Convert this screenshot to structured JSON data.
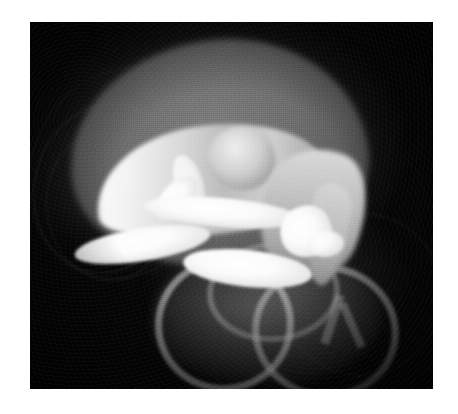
{
  "figure": {
    "kind": "grayscale-radiographic-scan",
    "modality_appearance": "micro-CT / x-ray volume rendering",
    "caption": "",
    "canvas": {
      "width_px": 458,
      "height_px": 414,
      "margin_color": "#ffffff"
    },
    "plate": {
      "left_px": 30,
      "top_px": 22,
      "width_px": 403,
      "height_px": 367,
      "background_color": "#050505"
    },
    "palette": {
      "background": "#050505",
      "page_margin": "#ffffff",
      "soft_tissue_mid": "#6e6e6e",
      "soft_tissue_light": "#8a8a8a",
      "dense_bone": "#ffffff",
      "bone_shadow": "#9a9a9a",
      "membrane_wisp": "#8c8c8c"
    },
    "structures": [
      {
        "id": "soft-tissue-mass",
        "label": "Soft tissue mass",
        "tone": "mid-gray",
        "region": "upper-left-center"
      },
      {
        "id": "bone-arc",
        "label": "Curved dense bone",
        "tone": "bright",
        "region": "upper-center"
      },
      {
        "id": "bone-arc-knob",
        "label": "Rounded bone head",
        "tone": "light-gray",
        "region": "center-upper"
      },
      {
        "id": "bone-arc-tail",
        "label": "Descending bone process",
        "tone": "light-gray",
        "region": "right-center"
      },
      {
        "id": "ossicle-cluster",
        "label": "Bright ossicle fragments",
        "tone": "very-bright",
        "region": "center"
      },
      {
        "id": "semicircular-canals",
        "label": "Ring / canal structures",
        "tone": "light-gray",
        "region": "lower-center-right"
      },
      {
        "id": "membrane-wisps",
        "label": "Faint membranous arcs",
        "tone": "dim",
        "region": "left-edge"
      }
    ],
    "ossicles": [
      {
        "id": "ossicle-1",
        "label": "Elongated rod, lower left"
      },
      {
        "id": "ossicle-2",
        "label": "Elongated rod, upper"
      },
      {
        "id": "ossicle-3",
        "label": "Short oblique strut"
      },
      {
        "id": "ossicle-4",
        "label": "Broad rod, lower"
      },
      {
        "id": "ossicle-5",
        "label": "Wedge fragment, right"
      },
      {
        "id": "ossicle-6",
        "label": "Thin vertical strut"
      },
      {
        "id": "ossicle-7",
        "label": "Small nodule, right"
      }
    ],
    "canals": [
      {
        "id": "canal-1",
        "label": "Anterior ring"
      },
      {
        "id": "canal-2",
        "label": "Posterior ring"
      },
      {
        "id": "canal-3",
        "label": "Upper connecting arc"
      }
    ]
  }
}
